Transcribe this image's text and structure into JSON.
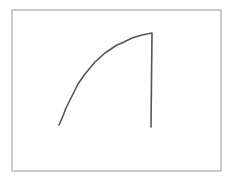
{
  "chart_data": {
    "type": "line",
    "title": "",
    "xlabel": "",
    "ylabel": "",
    "grid": false,
    "legend": null,
    "axes_visible": false,
    "frame": {
      "x": 12,
      "y": 10,
      "width": 209,
      "height": 161,
      "stroke": "#a8a8a8",
      "stroke_width": 1.2
    },
    "series": [
      {
        "name": "curve",
        "color": "#555555",
        "stroke_width": 1.6,
        "points_px": [
          [
            59,
            125
          ],
          [
            63,
            116
          ],
          [
            66,
            108
          ],
          [
            72,
            96
          ],
          [
            78,
            84
          ],
          [
            85,
            74
          ],
          [
            95,
            62
          ],
          [
            105,
            53
          ],
          [
            117,
            45
          ],
          [
            122,
            43
          ],
          [
            132,
            38
          ],
          [
            142,
            35
          ],
          [
            152,
            33
          ],
          [
            151,
            127
          ]
        ]
      }
    ]
  }
}
